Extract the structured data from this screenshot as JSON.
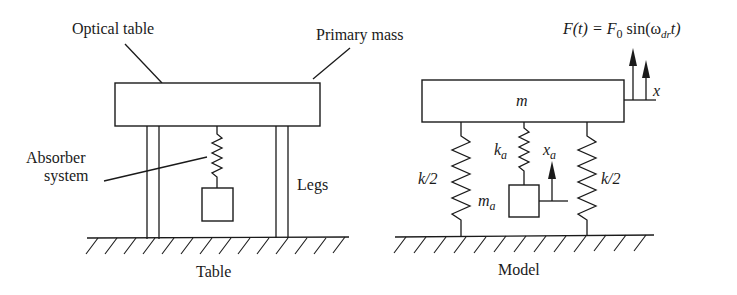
{
  "figure": {
    "left_panel": {
      "caption": "Table",
      "labels": {
        "optical_table": "Optical table",
        "primary_mass": "Primary mass",
        "absorber_line1": "Absorber",
        "absorber_line2": "system",
        "legs": "Legs"
      }
    },
    "right_panel": {
      "caption": "Model",
      "labels": {
        "mass": "m",
        "spring_left": "k/2",
        "spring_right": "k/2",
        "absorber_spring_k": "k",
        "absorber_spring_sub": "a",
        "absorber_mass_m": "m",
        "absorber_mass_sub": "a",
        "absorber_disp_x": "x",
        "absorber_disp_sub": "a",
        "primary_disp": "x"
      },
      "force": {
        "lhs": "F(t) = F",
        "f0_sub": "0",
        "mid": " sin(ω",
        "omega_sub": "dr",
        "rhs": "t)"
      }
    }
  }
}
